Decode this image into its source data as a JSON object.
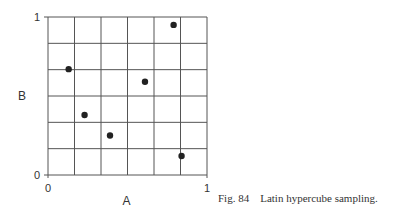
{
  "figure": {
    "caption": "Fig. 84    Latin hypercube sampling."
  },
  "chart_data": {
    "type": "scatter",
    "title": "",
    "xlabel": "A",
    "ylabel": "B",
    "xlim": [
      0,
      1
    ],
    "ylim": [
      0,
      1
    ],
    "x_ticks": [
      "0",
      "1"
    ],
    "y_ticks": [
      "0",
      "1"
    ],
    "grid": true,
    "grid_divisions": 6,
    "legend": null,
    "points": [
      {
        "x": 0.13,
        "y": 0.67
      },
      {
        "x": 0.23,
        "y": 0.38
      },
      {
        "x": 0.39,
        "y": 0.25
      },
      {
        "x": 0.61,
        "y": 0.59
      },
      {
        "x": 0.79,
        "y": 0.95
      },
      {
        "x": 0.84,
        "y": 0.12
      }
    ],
    "point_color": "#222222",
    "grid_color": "#555555"
  }
}
